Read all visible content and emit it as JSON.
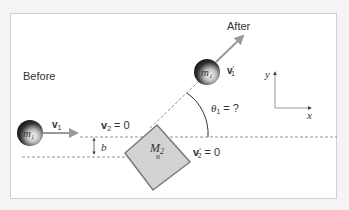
{
  "labels": {
    "before": "Before",
    "after": "After",
    "m1_before": "m",
    "m1_before_sub": "1",
    "m1_after": "m",
    "m1_after_sub": "1",
    "v1": "v",
    "v1_sub": "1",
    "v2_eq": "v",
    "v2_sub": "2",
    "v2_rhs": " = 0",
    "v1_prime": "v",
    "v1_prime_sub": "1",
    "v1_prime_mark": "′",
    "v2_prime": "v",
    "v2_prime_sub": "2",
    "v2_prime_mark": "′",
    "v2_prime_rhs": " = 0",
    "theta": "θ",
    "theta_sub": "1",
    "theta_rhs": " = ?",
    "b": "b",
    "M2": "M",
    "M2_sub": "2",
    "axis_x": "x",
    "axis_y": "y"
  },
  "colors": {
    "ball": "#222222",
    "arrow": "#999999",
    "block_fill": "#d3d3d3",
    "block_stroke": "#7a7a7a",
    "dash": "#777777",
    "text": "#333333"
  }
}
